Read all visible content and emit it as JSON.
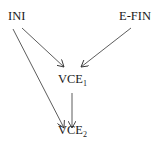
{
  "diagram": {
    "type": "directed-graph",
    "nodes": [
      {
        "id": "ini",
        "label": "INI",
        "sub": ""
      },
      {
        "id": "efin",
        "label": "E-FIN",
        "sub": ""
      },
      {
        "id": "vce1",
        "label": "VCE",
        "sub": "1"
      },
      {
        "id": "vce2",
        "label": "VCE",
        "sub": "2"
      }
    ],
    "edges": [
      {
        "from": "INI",
        "to": "VCE1"
      },
      {
        "from": "E-FIN",
        "to": "VCE1"
      },
      {
        "from": "VCE1",
        "to": "VCE2"
      },
      {
        "from": "INI",
        "to": "VCE2"
      }
    ],
    "colors": {
      "line": "#333333",
      "text": "#1a1a1a",
      "background": "#ffffff"
    }
  }
}
